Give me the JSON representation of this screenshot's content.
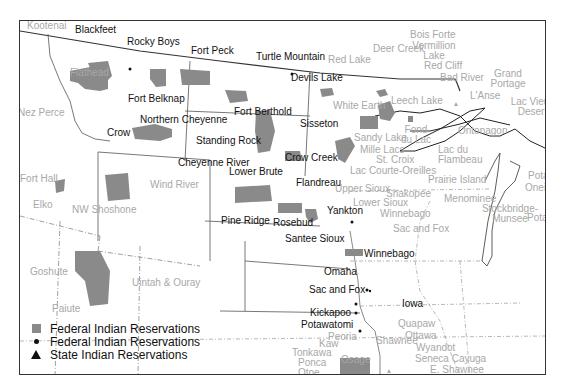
{
  "map": {
    "title": "Indian Reservations — Northern Plains and Upper Midwest",
    "colors": {
      "reservation_fill": "#8a8a8a",
      "dark_label": "#111111",
      "light_label": "#a8a8a8",
      "border": "#333333"
    },
    "labels_dark": {
      "blackfeet": "Blackfeet",
      "rocky_boys": "Rocky Boys",
      "fort_peck": "Fort Peck",
      "turtle_mountain": "Turtle Mountain",
      "devils_lake": "Devils Lake",
      "fort_belknap": "Fort Belknap",
      "fort_berthold": "Fort Berthold",
      "northern_cheyenne": "Northern Cheyenne",
      "crow": "Crow",
      "standing_rock": "Standing Rock",
      "sisseton": "Sisseton",
      "cheyenne_river": "Cheyenne River",
      "crow_creek": "Crow Creek",
      "lower_brute": "Lower Brute",
      "flandreau": "Flandreau",
      "yankton": "Yankton",
      "pine_ridge": "Pine Ridge",
      "rosebud": "Rosebud",
      "santee_sioux": "Santee Sioux",
      "winnebago": "Winnebago",
      "omaha": "Omaha",
      "sac_and_fox": "Sac and Fox",
      "iowa": "Iowa",
      "kickapoo": "Kickapoo",
      "potawatomi": "Potawatomi"
    },
    "labels_light": {
      "kootenai": "Kootenai",
      "flathead": "Flathead",
      "nez_perce": "Nez Perce",
      "fort_hall": "Fort Hall",
      "elko": "Elko",
      "nw_shoshone": "NW Shoshone",
      "wind_river": "Wind River",
      "goshute": "Goshute",
      "paiute": "Paiute",
      "uintah_ouray": "Uintah & Ouray",
      "bois_forte": "Bois Forte",
      "deer_creek": "Deer Creek",
      "vermillion_lake": "Vermillion Lake",
      "red_lake": "Red Lake",
      "red_cliff": "Red Cliff",
      "bad_river": "Bad River",
      "grand_portage": "Grand Portage",
      "lanse": "L'Anse",
      "lac_vieux_desert": "Lac Vieux Desert",
      "white_earth": "White Earth",
      "leech_lake": "Leech Lake",
      "ontonagon": "Ontonagon",
      "sandy_lake": "Sandy Lake",
      "fond_du_lac": "Fond du Lac",
      "mille_lacs": "Mille Lacs",
      "st_croix": "St. Croix",
      "lac_du_flambeau": "Lac du Flambeau",
      "lac_courte_oreilles": "Lac Courte-Oreilles",
      "prairie_island": "Prairie Island",
      "upper_sioux": "Upper Sioux",
      "shakopee": "Shakopee",
      "lower_sioux": "Lower Sioux",
      "menominee": "Menominee",
      "potawatomi_mi": "Potawatomi",
      "oneida": "Oneida",
      "stockbridge_munsee": "Stockbridge-Munsee",
      "winnebago_wi": "Winnebago",
      "sac_and_fox_ia": "Sac and Fox",
      "potawatomi_in": "Potawatomi",
      "peoria": "Peoria",
      "shawnee": "Shawnee",
      "quapaw": "Quapaw",
      "ottawa": "Ottawa",
      "kaw": "Kaw",
      "wyandot": "Wyandot",
      "tonkawa": "Tonkawa",
      "ponca": "Ponca",
      "osage": "Osage",
      "seneca_cayuga": "Seneca Cayuga",
      "otoe": "Otoe",
      "e_shawnee": "E. Shawnee"
    },
    "legend": [
      {
        "symbol": "square",
        "label": "Federal Indian Reservations"
      },
      {
        "symbol": "dot",
        "label": "Federal Indian Reservations"
      },
      {
        "symbol": "triangle",
        "label": "State Indian Reservations"
      }
    ]
  }
}
